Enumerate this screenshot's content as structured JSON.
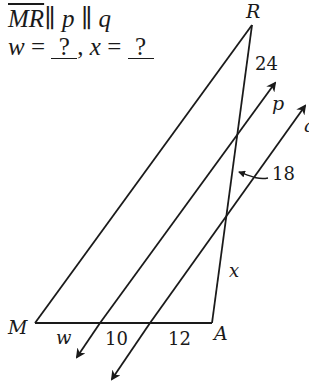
{
  "problem": {
    "given": {
      "segment": "MR",
      "parallel_symbol": "∥",
      "line_p": "p",
      "line_q": "q"
    },
    "unknowns": {
      "w_label": "w",
      "x_label": "x",
      "equals": "=",
      "separator": ",",
      "w_answer": "?",
      "x_answer": "?"
    }
  },
  "diagram": {
    "vertices": {
      "M": {
        "label": "M",
        "x": 35,
        "y": 323
      },
      "A": {
        "label": "A",
        "x": 212,
        "y": 323
      },
      "R": {
        "label": "R",
        "x": 252,
        "y": 25
      }
    },
    "lines": {
      "p": {
        "label": "p"
      },
      "q": {
        "label": "q"
      }
    },
    "segment_labels": {
      "RA_top": "24",
      "RA_middle": "18",
      "RA_bottom": "x",
      "MA_left": "w",
      "MA_middle": "10",
      "MA_right": "12"
    },
    "stroke_color": "#1a1a1a",
    "background": "#ffffff"
  }
}
